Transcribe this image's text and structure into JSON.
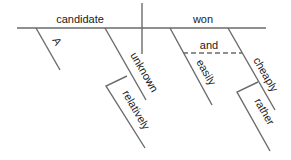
{
  "diagram": {
    "type": "sentence-diagram",
    "subject": "candidate",
    "verb": "won",
    "subject_modifiers": [
      "A",
      "unknown"
    ],
    "unknown_modifier": "relatively",
    "verb_modifiers": [
      "easily",
      "cheaply"
    ],
    "conjunction": "and",
    "cheaply_modifier": "rather"
  },
  "colors": {
    "line": "#6b6b6b",
    "text": "#1a1a1a",
    "background": "#ffffff"
  }
}
